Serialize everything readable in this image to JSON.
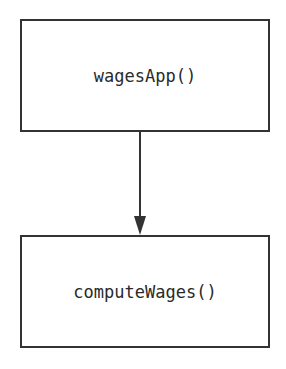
{
  "diagram": {
    "type": "call-graph",
    "nodes": [
      {
        "id": "wagesApp",
        "label": "wagesApp()"
      },
      {
        "id": "computeWages",
        "label": "computeWages()"
      }
    ],
    "edges": [
      {
        "from": "wagesApp",
        "to": "computeWages",
        "style": "arrow-down"
      }
    ],
    "colors": {
      "stroke": "#333333",
      "text": "#2a2a2a",
      "background": "#ffffff"
    }
  }
}
